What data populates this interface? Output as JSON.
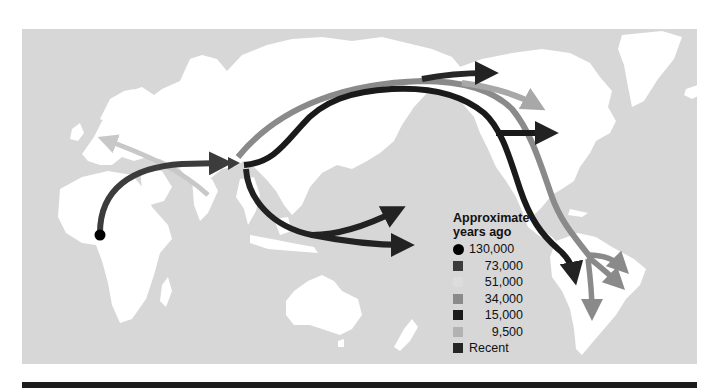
{
  "figure": {
    "type": "human-migration-map",
    "ocean_color": "#d7d7d7",
    "land_color": "#ffffff",
    "bottom_bar_color": "#1c1c1c"
  },
  "legend": {
    "title_line1": "Approximate",
    "title_line2": "years ago",
    "items": [
      {
        "label": "130,000",
        "shape": "circle",
        "color": "#000000"
      },
      {
        "label": "73,000",
        "shape": "square",
        "color": "#3c3c3c"
      },
      {
        "label": "51,000",
        "shape": "square",
        "color": "#dcdcdc"
      },
      {
        "label": "34,000",
        "shape": "square",
        "color": "#8a8a8a"
      },
      {
        "label": "15,000",
        "shape": "square",
        "color": "#1a1a1a"
      },
      {
        "label": "9,500",
        "shape": "square",
        "color": "#b2b2b2"
      },
      {
        "label": "Recent",
        "shape": "square",
        "color": "#262626"
      }
    ]
  },
  "routes": [
    {
      "name": "africa-to-asia",
      "era": "73,000",
      "color": "#3c3c3c"
    },
    {
      "name": "asia-to-europe",
      "era": "51,000",
      "color": "#c8c8c8"
    },
    {
      "name": "asia-to-oceania-north",
      "era": "15,000",
      "color": "#222222"
    },
    {
      "name": "asia-to-oceania-south",
      "era": "15,000",
      "color": "#222222"
    },
    {
      "name": "asia-to-americas-outer",
      "era": "34,000",
      "color": "#8a8a8a"
    },
    {
      "name": "asia-to-americas-inner",
      "era": "15,000",
      "color": "#1a1a1a"
    },
    {
      "name": "arctic-to-greenland",
      "era": "Recent",
      "color": "#262626"
    },
    {
      "name": "beringia-to-north-america",
      "era": "9,500",
      "color": "#a8a8a8"
    },
    {
      "name": "to-eastern-north-america",
      "era": "15,000",
      "color": "#1a1a1a"
    },
    {
      "name": "to-south-america-west",
      "era": "15,000",
      "color": "#1a1a1a"
    },
    {
      "name": "to-south-america-branches",
      "era": "34,000",
      "color": "#8a8a8a"
    }
  ],
  "origin": {
    "label": "Africa origin",
    "era": "130,000",
    "color": "#000000"
  }
}
